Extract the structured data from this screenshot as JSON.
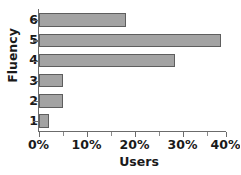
{
  "chart_data": {
    "type": "bar",
    "orientation": "horizontal",
    "title": "",
    "xlabel": "Users",
    "ylabel": "Fluency",
    "categories": [
      "1",
      "2",
      "3",
      "4",
      "5",
      "6"
    ],
    "values": [
      2.2,
      5.1,
      5.1,
      28.4,
      38.0,
      18.2
    ],
    "series": [
      {
        "name": "Users",
        "values": [
          2.2,
          5.1,
          5.1,
          28.4,
          38.0,
          18.2
        ]
      }
    ],
    "xlim": [
      0,
      39.1
    ],
    "ylim_categories_top_to_bottom": [
      "6",
      "5",
      "4",
      "3",
      "2",
      "1"
    ],
    "x_tick_values": [
      0,
      10,
      20,
      30,
      40
    ],
    "x_tick_labels": [
      "0%",
      "10%",
      "20%",
      "30%",
      "40%"
    ],
    "x_minor_tick_values": [
      5,
      15,
      25,
      35
    ],
    "y_tick_labels": [
      "6",
      "5",
      "4",
      "3",
      "2",
      "1"
    ],
    "grid": false,
    "legend": false,
    "value_unit": "%",
    "bars": [
      {
        "category": "6",
        "value": 18.2,
        "label": "18.2%"
      },
      {
        "category": "5",
        "value": 38.0,
        "label": "38.0%"
      },
      {
        "category": "4",
        "value": 28.4,
        "label": "28.4%"
      },
      {
        "category": "3",
        "value": 5.1,
        "label": "5.1%"
      },
      {
        "category": "2",
        "value": 5.1,
        "label": "5.1%"
      },
      {
        "category": "1",
        "value": 2.2,
        "label": "2.2%"
      }
    ]
  },
  "style": {
    "bar_fill": "#a3a3a3",
    "bar_border": "#5e5e5e",
    "axis_color": "#6b6b6b",
    "text_color": "#1a1a1a",
    "background": "#ffffff"
  }
}
